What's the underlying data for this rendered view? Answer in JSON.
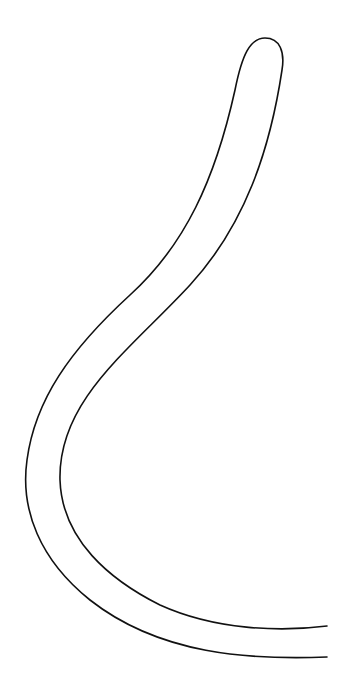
{
  "drawing": {
    "subject": "curved tube outline",
    "stroke_color": "#111111",
    "background": "#ffffff"
  }
}
